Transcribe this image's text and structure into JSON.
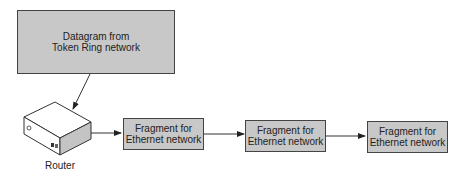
{
  "diagram": {
    "source_box": {
      "line1": "Datagram from",
      "line2": "Token Ring network"
    },
    "router": {
      "label": "Router"
    },
    "fragments": [
      {
        "line1": "Fragment for",
        "line2": "Ethernet network"
      },
      {
        "line1": "Fragment for",
        "line2": "Ethernet network"
      },
      {
        "line1": "Fragment for",
        "line2": "Ethernet network"
      }
    ],
    "colors": {
      "box_fill": "#c8c8c8",
      "stroke": "#444444"
    }
  }
}
